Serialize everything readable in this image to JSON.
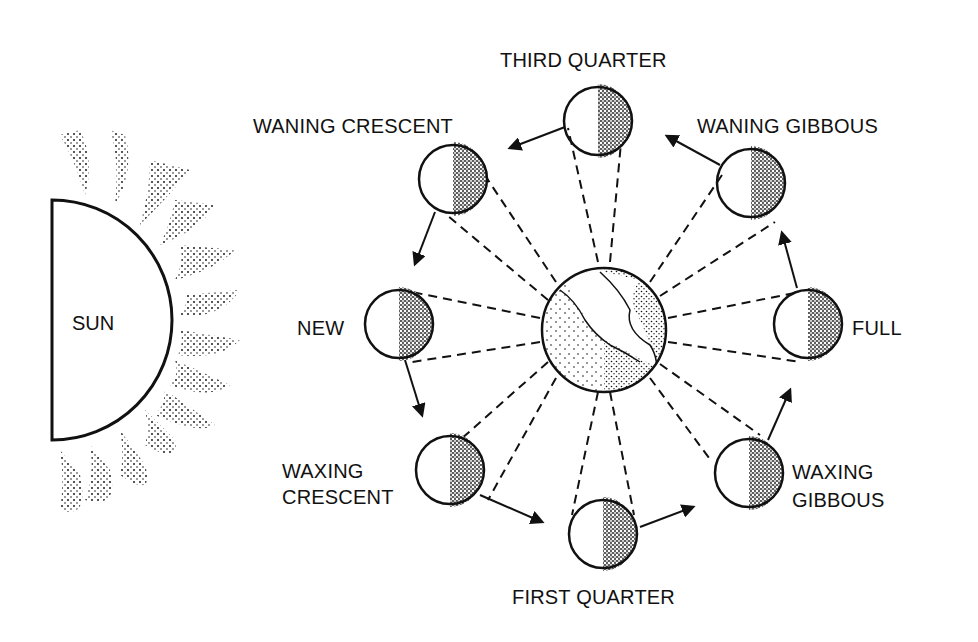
{
  "diagram": {
    "sun": {
      "label": "SUN"
    },
    "earth": {
      "label": "Earth"
    },
    "phases": [
      {
        "id": "new",
        "label": "NEW"
      },
      {
        "id": "waxing-crescent",
        "label_line1": "WAXING",
        "label_line2": "CRESCENT"
      },
      {
        "id": "first-quarter",
        "label": "FIRST QUARTER"
      },
      {
        "id": "waxing-gibbous",
        "label_line1": "WAXING",
        "label_line2": "GIBBOUS"
      },
      {
        "id": "full",
        "label": "FULL"
      },
      {
        "id": "waning-gibbous",
        "label": "WANING GIBBOUS"
      },
      {
        "id": "third-quarter",
        "label": "THIRD QUARTER"
      },
      {
        "id": "waning-crescent",
        "label": "WANING CRESCENT"
      }
    ],
    "colors": {
      "ink": "#111111",
      "background": "#ffffff"
    }
  }
}
